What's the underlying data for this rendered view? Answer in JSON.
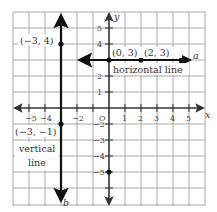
{
  "figure": {
    "axes": {
      "x_label": "x",
      "y_label": "y",
      "origin_label": "O",
      "x_ticks": [
        "−5",
        "−4",
        "−2",
        "1",
        "2",
        "3",
        "4",
        "5"
      ],
      "y_ticks": [
        "5",
        "4",
        "2",
        "1",
        "−2",
        "−3",
        "−4",
        "−5"
      ]
    },
    "lines": {
      "horizontal": {
        "name": "a",
        "caption": "horizontal line",
        "equation_y": 3
      },
      "vertical": {
        "name": "b",
        "caption_line1": "vertical",
        "caption_line2": "line",
        "equation_x": -3
      }
    },
    "points": {
      "p1": "(−3, 4)",
      "p2": "(−3, −1)",
      "p3": "(0, 3)",
      "p4": "(2, 3)"
    },
    "colors": {
      "grid": "#a8a8a8",
      "axis": "#333333",
      "line": "#111111",
      "text": "#333333"
    }
  }
}
